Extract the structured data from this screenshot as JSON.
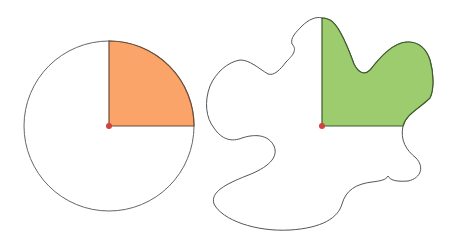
{
  "diagram": {
    "colors": {
      "background": "#ffffff",
      "outline": "#555555",
      "circle_sector_fill": "#fba46a",
      "circle_sector_edge": "#6b4a36",
      "blob_region_fill": "#9ccc6e",
      "blob_region_edge": "#3d5a2a",
      "center_point": "#d2423f"
    },
    "circle": {
      "center": [
        109,
        126
      ],
      "radius": 85,
      "shaded_sector": "top-right quarter (0° to 90°)"
    },
    "blob": {
      "center": [
        322,
        126
      ],
      "shaded_region": "top-right region bounded by vertical and horizontal radii"
    }
  }
}
